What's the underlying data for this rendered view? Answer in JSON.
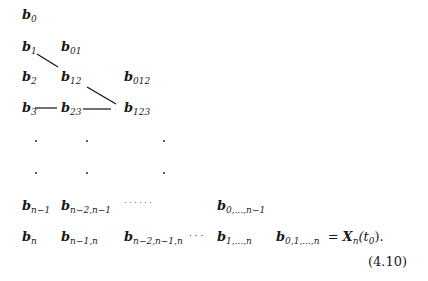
{
  "rows": [
    {
      "cells": [
        {
          "base": "b",
          "sub": "0"
        }
      ]
    },
    {
      "cells": [
        {
          "base": "b",
          "sub": "1"
        },
        {
          "base": "b",
          "sub": "01"
        }
      ]
    },
    {
      "cells": [
        {
          "base": "b",
          "sub": "2"
        },
        {
          "base": "b",
          "sub": "12"
        },
        {
          "base": "b",
          "sub": "012"
        }
      ]
    },
    {
      "cells": [
        {
          "base": "b",
          "sub": "3"
        },
        {
          "base": "b",
          "sub": "23"
        },
        {
          "base": "b",
          "sub": "123"
        }
      ]
    }
  ],
  "row_n_minus_1": {
    "c0": {
      "base": "b",
      "sub": "n−1"
    },
    "c1": {
      "base": "b",
      "sub": "n−2,n−1"
    },
    "ellipsis": "· · · · · ·",
    "c3": {
      "base": "b",
      "sub": "0,...,n−1"
    }
  },
  "row_n": {
    "c0": {
      "base": "b",
      "sub": "n"
    },
    "c1": {
      "base": "b",
      "sub": "n−1,n"
    },
    "c2": {
      "base": "b",
      "sub": "n−2,n−1,n"
    },
    "ellipsis": "· · ·",
    "c3": {
      "base": "b",
      "sub": "1,...,n"
    },
    "c4": {
      "base": "b",
      "sub": "0,1,...,n"
    },
    "equals": "=",
    "rhs_base": "X",
    "rhs_sub": "n",
    "rhs_arg": "(t",
    "rhs_arg_sub": "0",
    "rhs_close": ")."
  },
  "equation_number": "(4.10)"
}
